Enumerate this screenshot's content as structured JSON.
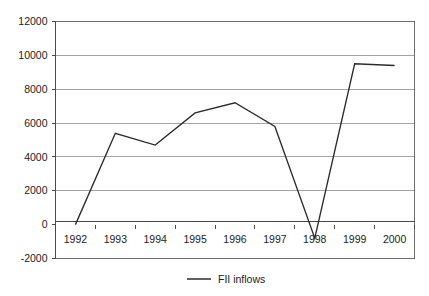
{
  "chart_data": {
    "type": "line",
    "title": "",
    "subtitle": "",
    "xlabel": "",
    "ylabel": "",
    "categories": [
      "1992",
      "1993",
      "1994",
      "1995",
      "1996",
      "1997",
      "1998",
      "1999",
      "2000"
    ],
    "series": [
      {
        "name": "FII inflows",
        "values": [
          0,
          5400,
          4700,
          6600,
          7200,
          5800,
          -800,
          9500,
          9400
        ],
        "color": "#2b2b2b"
      }
    ],
    "ylim": [
      -2000,
      12000
    ],
    "yticks": [
      -2000,
      0,
      2000,
      4000,
      6000,
      8000,
      10000,
      12000
    ],
    "ytick_labels": [
      "-2000",
      "0",
      "2000",
      "4000",
      "6000",
      "8000",
      "10000",
      "12000"
    ],
    "xtick_labels": [
      "1992",
      "1993",
      "1994",
      "1995",
      "1996",
      "1997",
      "1998",
      "1999",
      "2000"
    ],
    "grid": "horizontal",
    "legend_position": "bottom",
    "legend_entries": [
      "FII inflows"
    ],
    "background_color": "#ffffff",
    "gridline_color": "#9a9a9a"
  },
  "legend": {
    "label": "FII inflows"
  },
  "axis": {
    "y_labels": [
      "12000",
      "10000",
      "8000",
      "6000",
      "4000",
      "2000",
      "0",
      "-2000"
    ],
    "x_labels": [
      "1992",
      "1993",
      "1994",
      "1995",
      "1996",
      "1997",
      "1998",
      "1999",
      "2000"
    ]
  }
}
